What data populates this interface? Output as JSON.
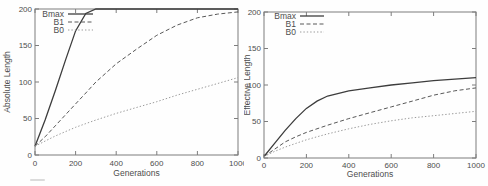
{
  "figure": {
    "background": "#fefefe",
    "axis_color": "#7d7d7d",
    "text_color": "#4d4d4d"
  },
  "series_colors": {
    "Bmax": "#3d3d3d",
    "B1": "#585858",
    "B0": "#9b9b9b"
  },
  "chart_data": [
    {
      "type": "line",
      "title": "",
      "xlabel": "Generations",
      "ylabel": "Absolute Length",
      "xlim": [
        0,
        1000
      ],
      "ylim": [
        0,
        200
      ],
      "xticks": [
        0,
        200,
        400,
        600,
        800,
        1000
      ],
      "yticks": [
        0,
        50,
        100,
        150,
        200
      ],
      "grid": false,
      "legend_position": "top-left",
      "legend": [
        "Bmax",
        "B1",
        "B0"
      ],
      "x": [
        0,
        50,
        100,
        150,
        200,
        250,
        300,
        400,
        500,
        600,
        700,
        800,
        900,
        1000
      ],
      "series": [
        {
          "name": "Bmax",
          "style": "solid",
          "values": [
            12,
            48,
            88,
            130,
            170,
            194,
            200,
            200,
            200,
            200,
            200,
            200,
            200,
            200
          ]
        },
        {
          "name": "B1",
          "style": "dashed",
          "values": [
            12,
            25,
            40,
            55,
            70,
            85,
            100,
            125,
            145,
            164,
            178,
            188,
            193,
            196
          ]
        },
        {
          "name": "B0",
          "style": "dotted",
          "values": [
            12,
            19,
            26,
            32,
            38,
            43,
            48,
            57,
            65,
            73,
            82,
            90,
            98,
            106
          ]
        }
      ]
    },
    {
      "type": "line",
      "title": "",
      "xlabel": "Generations",
      "ylabel": "Effective Length",
      "xlim": [
        0,
        1000
      ],
      "ylim": [
        0,
        200
      ],
      "xticks": [
        0,
        200,
        400,
        600,
        800,
        1000
      ],
      "yticks": [
        0,
        50,
        100,
        150,
        200
      ],
      "grid": false,
      "legend_position": "top-left",
      "legend": [
        "Bmax",
        "B1",
        "B0"
      ],
      "x": [
        0,
        50,
        100,
        150,
        200,
        250,
        300,
        400,
        500,
        600,
        700,
        800,
        900,
        1000
      ],
      "series": [
        {
          "name": "Bmax",
          "style": "solid",
          "values": [
            2,
            20,
            38,
            54,
            68,
            78,
            85,
            92,
            96,
            100,
            103,
            106,
            108,
            110
          ]
        },
        {
          "name": "B1",
          "style": "dashed",
          "values": [
            2,
            12,
            22,
            29,
            35,
            40,
            45,
            54,
            62,
            70,
            78,
            86,
            92,
            96
          ]
        },
        {
          "name": "B0",
          "style": "dotted",
          "values": [
            2,
            9,
            15,
            20,
            25,
            29,
            33,
            40,
            46,
            51,
            55,
            58,
            61,
            64
          ]
        }
      ]
    }
  ]
}
